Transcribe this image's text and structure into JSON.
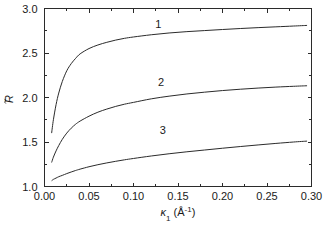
{
  "chart_data": {
    "type": "line",
    "title": "",
    "xlabel": "κ₁ (Å⁻¹)",
    "xlabel_parts": {
      "symbol": "κ",
      "subscript": "1",
      "unit_open": " (Å",
      "unit_exp": "-1",
      "unit_close": ")"
    },
    "ylabel": "R̃",
    "ylabel_parts": {
      "symbol": "R",
      "accent": "tilde"
    },
    "xlim": [
      0.0,
      0.3
    ],
    "ylim": [
      1.0,
      3.0
    ],
    "grid": false,
    "legend": "inline-curve-numbers",
    "x_ticks_major": [
      "0.00",
      "0.05",
      "0.10",
      "0.15",
      "0.20",
      "0.25",
      "0.30"
    ],
    "x_ticks_major_values": [
      0.0,
      0.05,
      0.1,
      0.15,
      0.2,
      0.25,
      0.3
    ],
    "x_minor_step": 0.025,
    "y_ticks_major": [
      "1.0",
      "1.5",
      "2.0",
      "2.5",
      "3.0"
    ],
    "y_ticks_major_values": [
      1.0,
      1.5,
      2.0,
      2.5,
      3.0
    ],
    "y_minor_step": 0.25,
    "annotations": [
      {
        "label": "1",
        "x": 0.128,
        "y": 2.83
      },
      {
        "label": "2",
        "x": 0.131,
        "y": 2.17
      },
      {
        "label": "3",
        "x": 0.133,
        "y": 1.63
      }
    ],
    "series": [
      {
        "name": "1",
        "label": "1",
        "x": [
          0.008,
          0.01,
          0.013,
          0.016,
          0.02,
          0.025,
          0.03,
          0.035,
          0.04,
          0.05,
          0.06,
          0.07,
          0.08,
          0.09,
          0.1,
          0.12,
          0.14,
          0.16,
          0.18,
          0.2,
          0.22,
          0.24,
          0.26,
          0.28,
          0.295
        ],
        "y": [
          1.6,
          1.75,
          1.92,
          2.05,
          2.18,
          2.3,
          2.38,
          2.44,
          2.49,
          2.55,
          2.59,
          2.62,
          2.645,
          2.665,
          2.68,
          2.705,
          2.725,
          2.74,
          2.752,
          2.764,
          2.775,
          2.785,
          2.794,
          2.803,
          2.81
        ]
      },
      {
        "name": "2",
        "label": "2",
        "x": [
          0.008,
          0.01,
          0.013,
          0.016,
          0.02,
          0.025,
          0.03,
          0.035,
          0.04,
          0.05,
          0.06,
          0.07,
          0.08,
          0.09,
          0.1,
          0.12,
          0.14,
          0.16,
          0.18,
          0.2,
          0.22,
          0.24,
          0.26,
          0.28,
          0.295
        ],
        "y": [
          1.27,
          1.33,
          1.4,
          1.46,
          1.53,
          1.6,
          1.655,
          1.7,
          1.735,
          1.79,
          1.835,
          1.87,
          1.9,
          1.925,
          1.945,
          1.985,
          2.015,
          2.04,
          2.06,
          2.078,
          2.093,
          2.106,
          2.117,
          2.126,
          2.132
        ]
      },
      {
        "name": "3",
        "label": "3",
        "x": [
          0.008,
          0.01,
          0.013,
          0.016,
          0.02,
          0.025,
          0.03,
          0.035,
          0.04,
          0.05,
          0.06,
          0.07,
          0.08,
          0.09,
          0.1,
          0.12,
          0.14,
          0.16,
          0.18,
          0.2,
          0.22,
          0.24,
          0.26,
          0.28,
          0.295
        ],
        "y": [
          1.065,
          1.08,
          1.095,
          1.11,
          1.125,
          1.145,
          1.163,
          1.18,
          1.195,
          1.222,
          1.245,
          1.265,
          1.283,
          1.3,
          1.315,
          1.343,
          1.368,
          1.39,
          1.41,
          1.43,
          1.449,
          1.467,
          1.484,
          1.5,
          1.51
        ]
      }
    ]
  }
}
